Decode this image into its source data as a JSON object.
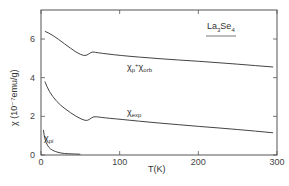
{
  "chart_data": {
    "type": "line",
    "title": "La3Se4",
    "xlabel": "T(K)",
    "ylabel": "χ (10⁻⁷emu/g)",
    "xlim": [
      0,
      300
    ],
    "ylim": [
      0,
      7
    ],
    "x_ticks": [
      0,
      100,
      200,
      300
    ],
    "y_ticks": [
      0,
      2,
      4,
      6
    ],
    "grid": false,
    "legend": "inline labels",
    "series": [
      {
        "name": "χp + χorb",
        "label_main": "χ",
        "label_sub": "p",
        "label_plus": "+",
        "label_main2": "χ",
        "label_sub2": "orb",
        "x": [
          5,
          15,
          30,
          45,
          55,
          60,
          65,
          70,
          100,
          150,
          200,
          250,
          295
        ],
        "y": [
          6.4,
          6.2,
          5.75,
          5.3,
          5.12,
          5.2,
          5.35,
          5.3,
          5.15,
          4.98,
          4.85,
          4.7,
          4.55
        ]
      },
      {
        "name": "χexp",
        "label_main": "χ",
        "label_sub": "exp",
        "x": [
          5,
          10,
          20,
          30,
          45,
          57,
          62,
          67,
          75,
          100,
          150,
          200,
          250,
          295
        ],
        "y": [
          3.8,
          3.3,
          2.75,
          2.4,
          1.98,
          1.75,
          1.85,
          2.0,
          1.95,
          1.85,
          1.65,
          1.48,
          1.32,
          1.15
        ]
      },
      {
        "name": "χpi",
        "label_main": "χ",
        "label_sub": "pi",
        "x": [
          3,
          5,
          8,
          12,
          18,
          25,
          35,
          50
        ],
        "y": [
          1.3,
          0.8,
          0.5,
          0.3,
          0.18,
          0.1,
          0.06,
          0.04
        ]
      }
    ]
  },
  "labels": {
    "title_main": "La",
    "title_sub1": "3",
    "title_mid": "Se",
    "title_sub2": "4",
    "xlabel": "T(K)",
    "ylabel": "χ (10⁻⁷emu/g)"
  }
}
